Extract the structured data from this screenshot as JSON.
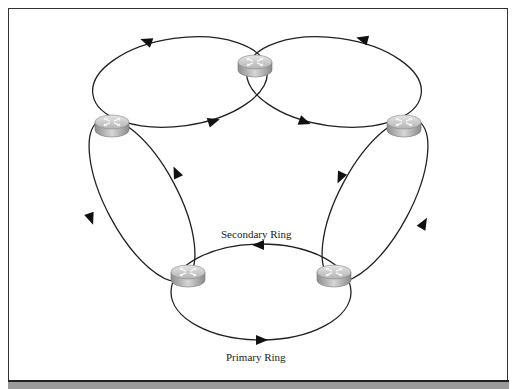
{
  "diagram": {
    "labels": {
      "secondary": "Secondary Ring",
      "primary": "Primary Ring"
    },
    "nodes": [
      {
        "id": "router-top",
        "icon": "router-icon",
        "x": 255,
        "y": 65
      },
      {
        "id": "router-left",
        "icon": "router-icon",
        "x": 112,
        "y": 125
      },
      {
        "id": "router-right",
        "icon": "router-icon",
        "x": 404,
        "y": 125
      },
      {
        "id": "router-bottom-left",
        "icon": "router-icon",
        "x": 188,
        "y": 275
      },
      {
        "id": "router-bottom-right",
        "icon": "router-icon",
        "x": 334,
        "y": 275
      }
    ],
    "links": [
      {
        "from": "router-left",
        "to": "router-top",
        "type": "dual-ring"
      },
      {
        "from": "router-top",
        "to": "router-right",
        "type": "dual-ring"
      },
      {
        "from": "router-right",
        "to": "router-bottom-right",
        "type": "dual-ring"
      },
      {
        "from": "router-bottom-right",
        "to": "router-bottom-left",
        "type": "dual-ring"
      },
      {
        "from": "router-bottom-left",
        "to": "router-left",
        "type": "dual-ring"
      }
    ],
    "colors": {
      "line": "#222222",
      "router_top": "#c8c8c8",
      "router_side": "#a8a8a8",
      "footer": "#9a9a9a"
    }
  }
}
